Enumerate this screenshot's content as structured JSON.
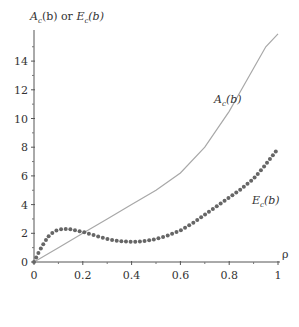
{
  "chart_data": {
    "type": "line",
    "title": "",
    "ylabel": "A_c(b) or E_c(b)",
    "xlabel": "ρ",
    "xlim": [
      0,
      1
    ],
    "ylim": [
      0,
      16
    ],
    "x_ticks": [
      0,
      0.2,
      0.4,
      0.6,
      0.8,
      1
    ],
    "x_tick_labels": [
      "0",
      "0.2",
      "0.4",
      "0.6",
      "0.8",
      "1"
    ],
    "y_ticks": [
      0,
      2,
      4,
      6,
      8,
      10,
      12,
      14
    ],
    "y_tick_labels": [
      "0",
      "2",
      "4",
      "6",
      "8",
      "10",
      "12",
      "14"
    ],
    "grid": false,
    "legend": "inline labels",
    "series": [
      {
        "name": "A_c(b)",
        "style": "solid line",
        "color": "#a8a8a8",
        "x": [
          0,
          0.1,
          0.2,
          0.3,
          0.4,
          0.5,
          0.6,
          0.7,
          0.8,
          0.85,
          0.9,
          0.95,
          1.0
        ],
        "y": [
          0,
          1.0,
          2.0,
          3.0,
          4.0,
          5.0,
          6.2,
          8.0,
          10.5,
          12.0,
          13.5,
          15.0,
          15.9
        ]
      },
      {
        "name": "E_c(b)",
        "style": "dotted markers",
        "color": "#666666",
        "x": [
          0,
          0.02,
          0.04,
          0.06,
          0.08,
          0.1,
          0.12,
          0.14,
          0.16,
          0.2,
          0.25,
          0.3,
          0.35,
          0.4,
          0.45,
          0.5,
          0.55,
          0.6,
          0.65,
          0.7,
          0.75,
          0.8,
          0.85,
          0.9,
          0.95,
          1.0
        ],
        "y": [
          0,
          0.7,
          1.3,
          1.8,
          2.1,
          2.25,
          2.3,
          2.3,
          2.25,
          2.1,
          1.85,
          1.6,
          1.45,
          1.4,
          1.45,
          1.6,
          1.85,
          2.2,
          2.7,
          3.3,
          3.9,
          4.5,
          5.1,
          5.8,
          6.8,
          7.9
        ]
      }
    ],
    "annotations": [
      {
        "text": "A_c(b)",
        "x": 0.78,
        "y": 11.8
      },
      {
        "text": "E_c(b)",
        "x": 0.92,
        "y": 4.5
      }
    ]
  },
  "labels": {
    "y_axis_A": "A",
    "y_axis_sub1": "c",
    "y_axis_mid": "(b) or ",
    "y_axis_E": "E",
    "y_axis_sub2": "c",
    "y_axis_end": "(b)",
    "x_axis": "ρ",
    "A_main": "A",
    "A_sub": "c",
    "A_end": "(b)",
    "E_main": "E",
    "E_sub": "c",
    "E_end": "(b)"
  }
}
